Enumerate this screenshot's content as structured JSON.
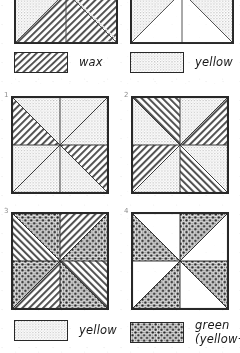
{
  "figure": {
    "title_visible": false,
    "panels_top": [
      {
        "name": "top-left-diagram",
        "number": "",
        "description": "square with two triangles filled with wax hatching on stippled ground",
        "regions": [
          {
            "id": "tl-upper-left",
            "fill": "stipple"
          },
          {
            "id": "tl-lower-left-triangle",
            "fill": "hatch"
          },
          {
            "id": "tl-right-upper",
            "fill": "hatch"
          },
          {
            "id": "tl-right-lower",
            "fill": "stipple"
          }
        ]
      },
      {
        "name": "top-right-diagram",
        "number": "",
        "description": "square with two white triangles on stippled ground",
        "regions": [
          {
            "id": "tr-left-triangle",
            "fill": "white"
          },
          {
            "id": "tr-right-triangle",
            "fill": "white"
          },
          {
            "id": "tr-ground",
            "fill": "stipple"
          }
        ]
      }
    ],
    "panels_numbered": [
      {
        "name": "panel-1",
        "number": "1",
        "wedges": [
          "stipple",
          "stipple",
          "hatch",
          "stipple",
          "stipple",
          "stipple",
          "hatch",
          "stipple"
        ]
      },
      {
        "name": "panel-2",
        "number": "2",
        "wedges": [
          "hatch",
          "stipple",
          "stipple",
          "hatch",
          "hatch",
          "stipple",
          "stipple",
          "hatch"
        ]
      },
      {
        "name": "panel-3",
        "number": "3",
        "wedges": [
          "hatch",
          "dots",
          "hatch",
          "dots",
          "hatch",
          "dots",
          "hatch",
          "dots"
        ]
      },
      {
        "name": "panel-4",
        "number": "4",
        "wedges": [
          "white",
          "dots",
          "stipple",
          "dots",
          "white",
          "dots",
          "stipple",
          "dots"
        ]
      }
    ]
  },
  "legends": {
    "top_left": {
      "name": "legend-wax",
      "label": "wax",
      "swatch_fill": "hatch"
    },
    "top_right": {
      "name": "legend-yellow",
      "label": "yellow",
      "swatch_fill": "stipple"
    },
    "bottom_left": {
      "name": "legend-yellow-2",
      "label": "yellow",
      "swatch_fill": "stipple"
    },
    "bottom_right": {
      "name": "legend-green",
      "label": "green",
      "label_line2": "(yellow+",
      "swatch_fill": "dots"
    }
  },
  "colors": {
    "ink": "#2b2b2b",
    "stipple": "#d7d7d7",
    "paper": "#ffffff"
  }
}
